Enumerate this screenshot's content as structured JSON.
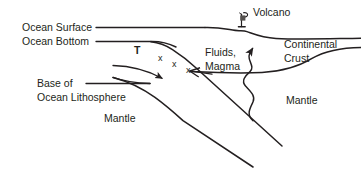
{
  "diagram": {
    "background_color": "#ffffff",
    "line_color": "#231f20",
    "text_color": "#231f20"
  },
  "labels": {
    "ocean_surface": "Ocean Surface",
    "ocean_bottom": "Ocean Bottom",
    "base_of": "Base of",
    "ocean_lithosphere": "Ocean Lithosphere",
    "mantle_left": "Mantle",
    "temperature_marker": "T",
    "x_mark_1": "x",
    "x_mark_2": "x",
    "x_mark_3": "x",
    "fluids": "Fluids,",
    "magma": "Magma",
    "volcano": "Volcano",
    "continental": "Continental",
    "crust": "Crust",
    "mantle_right": "Mantle"
  },
  "icons": {
    "volcano_marker": "volcano-icon",
    "magma_arrow": "arrow-up-icon",
    "slab_arrow": "arrow-down-right-icon",
    "convergence_arrow": "arrow-left-icon"
  }
}
